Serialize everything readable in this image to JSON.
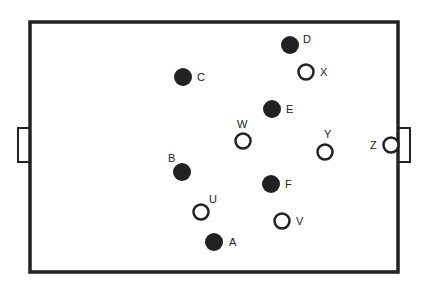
{
  "diagram": {
    "type": "football-pitch-positions",
    "colors": {
      "line": "#222222",
      "team_filled": "#222222",
      "team_open_stroke": "#222222",
      "background": "#ffffff"
    },
    "pitch": {
      "left": 30,
      "top": 22,
      "right": 398,
      "bottom": 272
    },
    "goals": [
      {
        "id": "left-goal",
        "x": 18,
        "y": 128,
        "w": 12,
        "h": 34
      },
      {
        "id": "right-goal",
        "x": 398,
        "y": 128,
        "w": 12,
        "h": 34
      }
    ],
    "players": [
      {
        "label": "A",
        "team": "filled",
        "x": 214,
        "y": 242,
        "lx": 229,
        "ly": 246
      },
      {
        "label": "B",
        "team": "filled",
        "x": 182,
        "y": 172,
        "lx": 168,
        "ly": 162
      },
      {
        "label": "C",
        "team": "filled",
        "x": 183,
        "y": 77,
        "lx": 197,
        "ly": 81
      },
      {
        "label": "D",
        "team": "filled",
        "x": 290,
        "y": 45,
        "lx": 303,
        "ly": 43
      },
      {
        "label": "E",
        "team": "filled",
        "x": 272,
        "y": 109,
        "lx": 286,
        "ly": 113
      },
      {
        "label": "F",
        "team": "filled",
        "x": 271,
        "y": 184,
        "lx": 285,
        "ly": 188
      },
      {
        "label": "U",
        "team": "open",
        "x": 201,
        "y": 212,
        "lx": 209,
        "ly": 203
      },
      {
        "label": "V",
        "team": "open",
        "x": 282,
        "y": 221,
        "lx": 296,
        "ly": 225
      },
      {
        "label": "W",
        "team": "open",
        "x": 243,
        "y": 141,
        "lx": 237,
        "ly": 128
      },
      {
        "label": "X",
        "team": "open",
        "x": 306,
        "y": 72,
        "lx": 320,
        "ly": 76
      },
      {
        "label": "Y",
        "team": "open",
        "x": 325,
        "y": 152,
        "lx": 324,
        "ly": 138
      },
      {
        "label": "Z",
        "team": "open",
        "x": 391,
        "y": 145,
        "lx": 370,
        "ly": 149
      }
    ]
  }
}
